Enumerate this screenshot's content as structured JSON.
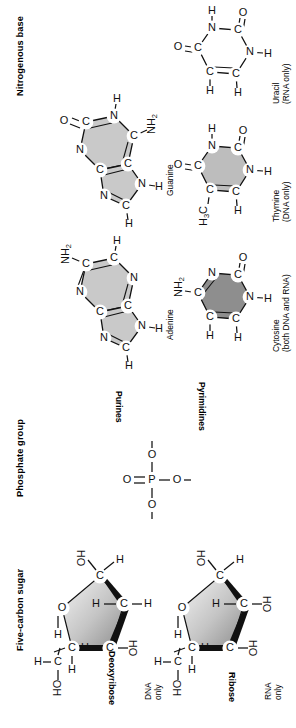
{
  "figure": {
    "title_visible": false,
    "orientation": "rotated-90-ccw",
    "sections": [
      {
        "id": "nitrogenous-base",
        "label": "Nitrogenous base"
      },
      {
        "id": "phosphate-group",
        "label": "Phosphate group"
      },
      {
        "id": "five-carbon-sugar",
        "label": "Five-carbon sugar"
      }
    ],
    "group_labels": {
      "purines": "Purines",
      "pyrimidines": "Pyrimidines"
    },
    "molecules": [
      {
        "id": "guanine",
        "name": "Guanine",
        "note": "",
        "class": "purine",
        "shade": "light"
      },
      {
        "id": "adenine",
        "name": "Adenine",
        "note": "",
        "class": "purine",
        "shade": "light"
      },
      {
        "id": "uracil",
        "name": "Uracil",
        "note": "(RNA only)",
        "class": "pyrimidine",
        "shade": "none"
      },
      {
        "id": "thymine",
        "name": "Thymine",
        "note": "(DNA only)",
        "class": "pyrimidine",
        "shade": "mid"
      },
      {
        "id": "cytosine",
        "name": "Cytosine",
        "note": "(both DNA and RNA)",
        "class": "pyrimidine",
        "shade": "dark"
      }
    ],
    "phosphate": {
      "center_atom": "P",
      "atoms": [
        "O",
        "O",
        "O",
        "O"
      ],
      "charges": [
        "–",
        "–",
        "–"
      ],
      "double_bond_atom": "O"
    },
    "sugars": [
      {
        "id": "deoxyribose",
        "name": "Deoxyribose",
        "note_line1": "DNA",
        "note_line2": "only",
        "ring_atoms": [
          "C",
          "C",
          "C",
          "C",
          "O"
        ],
        "substituents": [
          "OH",
          "H",
          "H",
          "H",
          "H",
          "OH",
          "H",
          "HO",
          "C",
          "H",
          "H"
        ]
      },
      {
        "id": "ribose",
        "name": "Ribose",
        "note_line1": "RNA",
        "note_line2": "only",
        "ring_atoms": [
          "C",
          "C",
          "C",
          "C",
          "O"
        ],
        "substituents": [
          "OH",
          "H",
          "H",
          "OH",
          "H",
          "OH",
          "H",
          "HO",
          "C",
          "H",
          "H"
        ]
      }
    ],
    "atom_labels": {
      "carbon": "C",
      "nitrogen": "N",
      "oxygen": "O",
      "hydrogen": "H",
      "amino": "NH",
      "amino_sub": "2",
      "methyl": "H",
      "methyl_sub": "3",
      "methyl_c": "C",
      "hydroxyl": "OH",
      "hydroxyl_rev": "HO",
      "phosphorus": "P"
    },
    "colors": {
      "background": "#ffffff",
      "ink": "#111111",
      "purine_shade": "#c9c9c9",
      "thymine_shade": "#bdbdbd",
      "cytosine_shade": "#8e8e8e",
      "uracil_shade": "#ffffff",
      "sugar_shade_light": "#f2f2f2",
      "sugar_shade_dark": "#9a9a9a"
    }
  }
}
